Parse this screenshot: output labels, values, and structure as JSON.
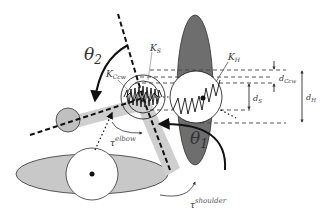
{
  "diagram": {
    "type": "arm-model-schematic",
    "labels": {
      "theta2": "θ",
      "theta2_sub": "2",
      "theta1": "θ",
      "theta1_sub": "1",
      "k_s": "K",
      "k_s_sub": "S",
      "k_h": "K",
      "k_h_sub": "H",
      "k_ccw": "K",
      "k_ccw_sub": "Ccw",
      "d_ccw": "d",
      "d_ccw_sub": "Ccw",
      "d_s": "d",
      "d_s_sub": "S",
      "d_h": "d",
      "d_h_sub": "H",
      "tau_elbow": "τ",
      "tau_elbow_sup": "elbow",
      "tau_shoulder": "τ",
      "tau_shoulder_sup": "shoulder"
    },
    "colors": {
      "dark_ellipse": "#6e6e6e",
      "light_ellipse": "#c8c8c8",
      "limb_band": "#cfcfcf",
      "line": "#111111",
      "dashed_guides": "#444444"
    }
  }
}
